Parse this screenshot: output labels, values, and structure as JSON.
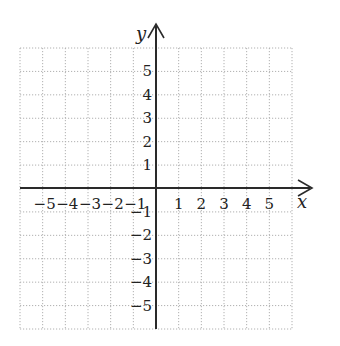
{
  "diagram": {
    "type": "cartesian-coordinate-grid",
    "x_axis": {
      "label": "x",
      "range": [
        -6,
        6
      ],
      "positive_ticks": [
        "1",
        "2",
        "3",
        "4",
        "5"
      ],
      "negative_ticks": [
        "−5",
        "−4",
        "−3",
        "−2",
        "−1"
      ]
    },
    "y_axis": {
      "label": "y",
      "range": [
        -6,
        6
      ],
      "positive_ticks": [
        "1",
        "2",
        "3",
        "4",
        "5"
      ],
      "negative_ticks": [
        "−1",
        "−2",
        "−3",
        "−4",
        "−5"
      ]
    },
    "grid": {
      "style": "dotted",
      "cells_x": 12,
      "cells_y": 12
    },
    "colors": {
      "axis": "#2a2a2a",
      "grid": "#b0b0b0",
      "text": "#222222",
      "background": "#ffffff"
    }
  }
}
